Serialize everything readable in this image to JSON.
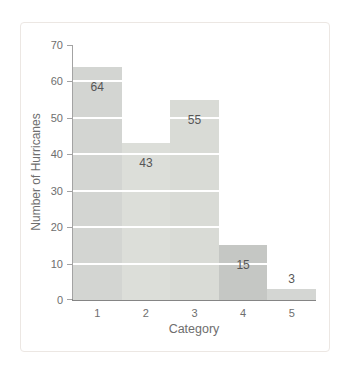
{
  "chart_data": {
    "type": "bar",
    "title": "",
    "xlabel": "Category",
    "ylabel": "Number of Hurricanes",
    "categories": [
      "1",
      "2",
      "3",
      "4",
      "5"
    ],
    "values": [
      64,
      43,
      55,
      15,
      3
    ],
    "bar_value_labels": [
      "64",
      "43",
      "55",
      "15",
      "3"
    ],
    "ylim": [
      0,
      70
    ],
    "yticks": [
      "0",
      "10",
      "20",
      "30",
      "40",
      "50",
      "60",
      "70"
    ],
    "grid": "horizontal white lines at each y tick, drawn over bars",
    "legend": "none",
    "bar_colors": [
      "#d3d5d2",
      "#dcded9",
      "#d9dbd6",
      "#c5c7c4",
      "#d4d6d3"
    ],
    "colors": {
      "gridline": "#ffffff",
      "axis_line": "#a3a3a3",
      "baseline": "#858585",
      "tick_text": "#6e6e6e",
      "bar_label_text": "#565656",
      "axis_title_text": "#6e6e6e",
      "frame_border": "#ece7e3",
      "background": "#ffffff"
    }
  }
}
